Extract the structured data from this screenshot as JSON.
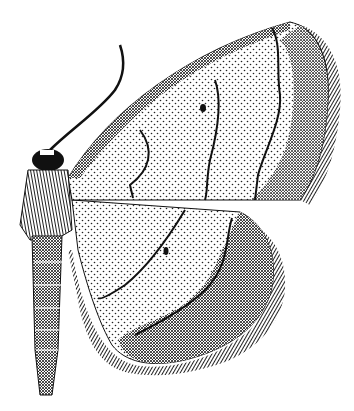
{
  "figure": {
    "style": "black and white stippled engraving",
    "view": "dorsal half, left side body with right wings spread",
    "colors": {
      "background": "#ffffff",
      "ink": "#111111",
      "stipple": "#222222"
    },
    "parts": [
      "antenna",
      "head",
      "thorax",
      "abdomen",
      "forewing",
      "hindwing",
      "wing-fringe",
      "discal-spot-forewing",
      "discal-spot-hindwing",
      "cross-lines"
    ]
  }
}
